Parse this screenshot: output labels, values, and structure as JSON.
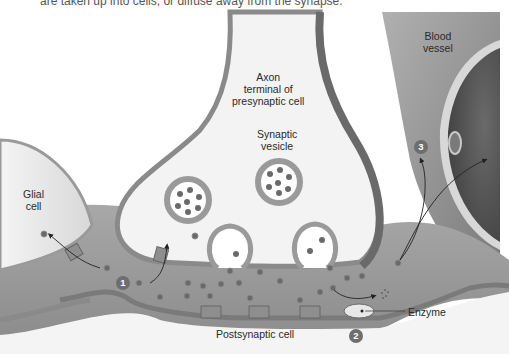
{
  "caption_fragment": "are taken up into cells, or diffuse away from the synapse.",
  "labels": {
    "axon_line1": "Axon",
    "axon_line2": "terminal of",
    "axon_line3": "presynaptic cell",
    "vesicle_line1": "Synaptic",
    "vesicle_line2": "vesicle",
    "glial_line1": "Glial",
    "glial_line2": "cell",
    "blood_line1": "Blood",
    "blood_line2": "vessel",
    "postsynaptic": "Postsynaptic cell",
    "enzyme": "Enzyme"
  },
  "steps": [
    {
      "number": "1",
      "meaning": "reuptake into glial cell / presynaptic terminal"
    },
    {
      "number": "2",
      "meaning": "enzymatic degradation"
    },
    {
      "number": "3",
      "meaning": "diffusion away into blood vessel"
    }
  ],
  "colors": {
    "cleft_fill": "#9a9a9a",
    "membrane": "#8a8a8a",
    "cell_interior": "#f2f2f2",
    "neurotransmitter": "#6a6a6a",
    "vessel_dark": "#5a5a5a",
    "badge": "#6e6e6e"
  }
}
